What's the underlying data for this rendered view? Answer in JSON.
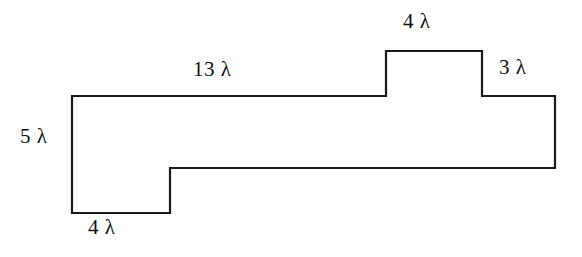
{
  "figure": {
    "kind": "dimensioned-polygon-diagram",
    "symbol": "λ",
    "stroke_color": "#1a1a1a",
    "fill_color": "#ffffff",
    "background_color": "#ffffff",
    "stroke_width": 2.2
  },
  "labels": {
    "top_width": "13 λ",
    "bump_width": "4 λ",
    "right_width": "3 λ",
    "left_height": "5 λ",
    "bottom_width": "4 λ"
  },
  "chart_data": {
    "type": "diagram",
    "title": "",
    "xlabel": "",
    "ylabel": "",
    "units": "λ",
    "shape": {
      "name": "stepped-polygon",
      "closed": true,
      "vertices_px": [
        [
          72,
          96
        ],
        [
          386,
          96
        ],
        [
          386,
          51
        ],
        [
          482,
          51
        ],
        [
          482,
          96
        ],
        [
          555,
          96
        ],
        [
          555,
          168
        ],
        [
          170,
          168
        ],
        [
          170,
          213
        ],
        [
          72,
          213
        ]
      ],
      "vertices_lambda": [
        [
          0,
          5
        ],
        [
          13,
          5
        ],
        [
          13,
          7
        ],
        [
          17,
          7
        ],
        [
          17,
          5
        ],
        [
          20,
          5
        ],
        [
          20,
          2
        ],
        [
          4,
          2
        ],
        [
          4,
          0
        ],
        [
          0,
          0
        ]
      ]
    },
    "dimensions": [
      {
        "name": "top-width",
        "value": 13,
        "units": "λ",
        "label": "13 λ",
        "edge": "top-left-horizontal",
        "orientation": "horizontal"
      },
      {
        "name": "bump-width",
        "value": 4,
        "units": "λ",
        "label": "4 λ",
        "edge": "bump-top-horizontal",
        "orientation": "horizontal"
      },
      {
        "name": "right-width",
        "value": 3,
        "units": "λ",
        "label": "3 λ",
        "edge": "top-right-horizontal",
        "orientation": "horizontal"
      },
      {
        "name": "left-height",
        "value": 5,
        "units": "λ",
        "label": "5 λ",
        "edge": "left-vertical",
        "orientation": "vertical"
      },
      {
        "name": "bottom-width",
        "value": 4,
        "units": "λ",
        "label": "4 λ",
        "edge": "bottom-horizontal",
        "orientation": "horizontal"
      }
    ]
  }
}
